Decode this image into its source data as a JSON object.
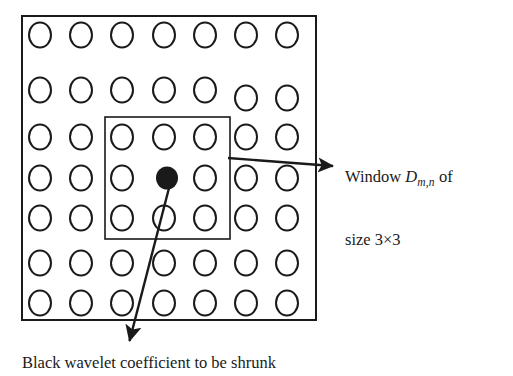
{
  "figure": {
    "type": "diagram",
    "background_color": "#ffffff",
    "stroke_color": "#1a1a1a",
    "fill_black": "#1a1a1a",
    "width": 513,
    "height": 376
  },
  "outer_box": {
    "name": "coefficient-grid-boundary",
    "x": 22,
    "y": 16,
    "width": 294,
    "height": 304,
    "stroke_width": 2
  },
  "window_box": {
    "name": "window-3x3-boundary",
    "x": 105,
    "y": 117,
    "width": 125,
    "height": 122,
    "stroke_width": 1.6
  },
  "grid": {
    "columns": 7,
    "rows": 7,
    "column_centers": [
      40,
      81,
      122,
      164,
      205,
      246,
      287
    ],
    "row_centers": [
      35,
      90,
      137,
      178,
      218,
      263,
      303
    ],
    "circle_radius_x": 11,
    "circle_radius_y": 12.5,
    "circle_stroke_width": 2,
    "row_offsets": [
      [
        0,
        0,
        0,
        0,
        0,
        0,
        0
      ],
      [
        0,
        0,
        0,
        0,
        0,
        8,
        8
      ],
      [
        0,
        0,
        0,
        0,
        0,
        0,
        0
      ],
      [
        0,
        0,
        0,
        0,
        0,
        0,
        0
      ],
      [
        0,
        0,
        0,
        0,
        0,
        0,
        0
      ],
      [
        0,
        0,
        0,
        0,
        0,
        0,
        0
      ],
      [
        0,
        0,
        0,
        0,
        0,
        0,
        0
      ]
    ]
  },
  "black_coefficient": {
    "name": "black-wavelet-coefficient",
    "cx": 167,
    "cy": 178,
    "rx": 11,
    "ry": 11.5
  },
  "arrows": [
    {
      "name": "window-callout-arrow",
      "x1": 228,
      "y1": 158,
      "x2": 340,
      "y2": 166,
      "stroke_width": 2.4,
      "head_length": 15,
      "head_width": 11
    },
    {
      "name": "coefficient-callout-arrow",
      "x1": 169,
      "y1": 188,
      "x2": 128,
      "y2": 348,
      "stroke_width": 2.4,
      "head_length": 19,
      "head_width": 13
    }
  ],
  "labels": {
    "window": {
      "line1_prefix": "Window ",
      "variable": "D",
      "subscript": "m,n",
      "line1_suffix": " of",
      "line2": "size 3×3",
      "full_text": "Window D m,n of size 3×3"
    },
    "caption": {
      "text": "Black wavelet coefficient to be shrunk"
    }
  }
}
